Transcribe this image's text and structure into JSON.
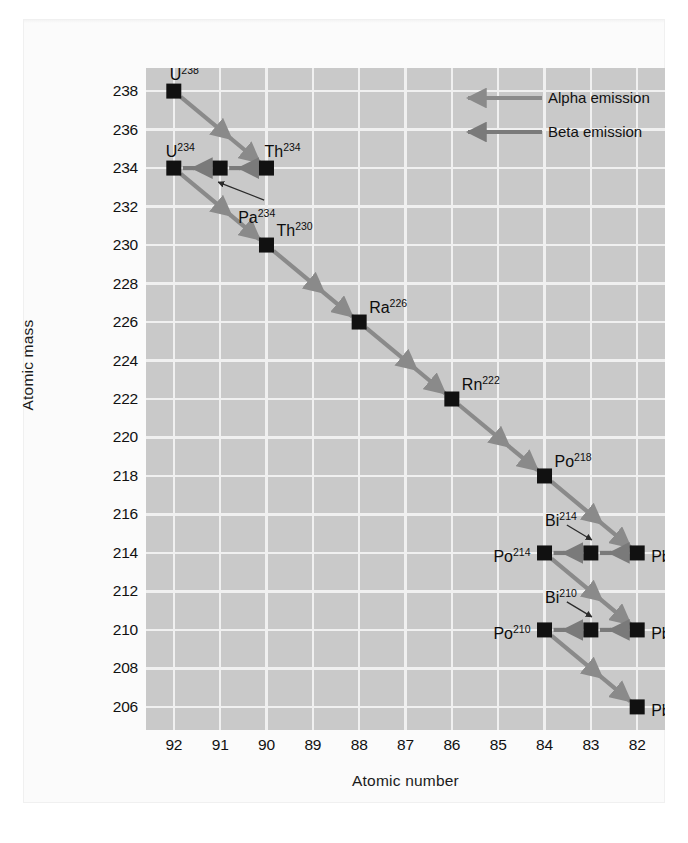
{
  "chart_data": {
    "type": "scatter",
    "title": "",
    "xlabel": "Atomic number",
    "ylabel": "Atomic mass",
    "xticks": [
      92,
      91,
      90,
      89,
      88,
      87,
      86,
      85,
      84,
      83,
      82
    ],
    "yticks": [
      238,
      236,
      234,
      232,
      230,
      228,
      226,
      224,
      222,
      220,
      218,
      216,
      214,
      212,
      210,
      208,
      206
    ],
    "xlim": [
      92.6,
      81.4
    ],
    "ylim": [
      204.8,
      239.2
    ],
    "x_axis_reversed": true,
    "grid": true,
    "grid_color": "#f0f0f0",
    "plot_background": "#c9c9c9",
    "marker": "square",
    "marker_color": "#111111",
    "arrow_color": "#6e6e6e",
    "legend_position": "top-right",
    "legend": [
      {
        "label": "Alpha emission",
        "color": "#8a8a8a",
        "type": "alpha"
      },
      {
        "label": "Beta emission",
        "color": "#7a7a7a",
        "type": "beta"
      }
    ],
    "points": [
      {
        "id": "U238",
        "element": "U",
        "mass": 238,
        "z": 92,
        "label": "U",
        "sup": "238",
        "label_dx": -4,
        "label_dy": -24,
        "label_align": "left"
      },
      {
        "id": "Th234",
        "element": "Th",
        "mass": 234,
        "z": 90,
        "label": "Th",
        "sup": "234",
        "label_dx": -2,
        "label_dy": -24,
        "label_align": "left"
      },
      {
        "id": "Pa234",
        "element": "Pa",
        "mass": 234,
        "z": 91,
        "label": "Pa",
        "sup": "234",
        "label_dx": 18,
        "label_dy": 42,
        "label_align": "left",
        "leader": true
      },
      {
        "id": "U234",
        "element": "U",
        "mass": 234,
        "z": 92,
        "label": "U",
        "sup": "234",
        "label_dx": -8,
        "label_dy": -24,
        "label_align": "left"
      },
      {
        "id": "Th230",
        "element": "Th",
        "mass": 230,
        "z": 90,
        "label": "Th",
        "sup": "230",
        "label_dx": 10,
        "label_dy": -22,
        "label_align": "left"
      },
      {
        "id": "Ra226",
        "element": "Ra",
        "mass": 226,
        "z": 88,
        "label": "Ra",
        "sup": "226",
        "label_dx": 10,
        "label_dy": -22,
        "label_align": "left"
      },
      {
        "id": "Rn222",
        "element": "Rn",
        "mass": 222,
        "z": 86,
        "label": "Rn",
        "sup": "222",
        "label_dx": 10,
        "label_dy": -22,
        "label_align": "left"
      },
      {
        "id": "Po218",
        "element": "Po",
        "mass": 218,
        "z": 84,
        "label": "Po",
        "sup": "218",
        "label_dx": 10,
        "label_dy": -22,
        "label_align": "left"
      },
      {
        "id": "Pb214",
        "element": "Pb",
        "mass": 214,
        "z": 82,
        "label": "Pb",
        "sup": "214",
        "label_dx": 14,
        "label_dy": -4,
        "label_align": "left"
      },
      {
        "id": "Bi214",
        "element": "Bi",
        "mass": 214,
        "z": 83,
        "label": "Bi",
        "sup": "214",
        "label_dx": -14,
        "label_dy": -40,
        "label_align": "right",
        "leader": true
      },
      {
        "id": "Po214",
        "element": "Po",
        "mass": 214,
        "z": 84,
        "label": "Po",
        "sup": "214",
        "label_dx": -14,
        "label_dy": -4,
        "label_align": "right"
      },
      {
        "id": "Pb210",
        "element": "Pb",
        "mass": 210,
        "z": 82,
        "label": "Pb",
        "sup": "210",
        "label_dx": 14,
        "label_dy": -4,
        "label_align": "left"
      },
      {
        "id": "Bi210",
        "element": "Bi",
        "mass": 210,
        "z": 83,
        "label": "Bi",
        "sup": "210",
        "label_dx": -14,
        "label_dy": -40,
        "label_align": "right",
        "leader": true
      },
      {
        "id": "Po210",
        "element": "Po",
        "mass": 210,
        "z": 84,
        "label": "Po",
        "sup": "210",
        "label_dx": -14,
        "label_dy": -4,
        "label_align": "right"
      },
      {
        "id": "Pb206",
        "element": "Pb",
        "mass": 206,
        "z": 82,
        "label": "Pb",
        "sup": "206",
        "label_dx": 14,
        "label_dy": -4,
        "label_align": "left"
      }
    ],
    "decays": [
      {
        "from": "U238",
        "to": "Th234",
        "type": "alpha"
      },
      {
        "from": "Th234",
        "to": "Pa234",
        "type": "beta"
      },
      {
        "from": "Pa234",
        "to": "U234",
        "type": "beta"
      },
      {
        "from": "U234",
        "to": "Th230",
        "type": "alpha"
      },
      {
        "from": "Th230",
        "to": "Ra226",
        "type": "alpha"
      },
      {
        "from": "Ra226",
        "to": "Rn222",
        "type": "alpha"
      },
      {
        "from": "Rn222",
        "to": "Po218",
        "type": "alpha"
      },
      {
        "from": "Po218",
        "to": "Pb214",
        "type": "alpha"
      },
      {
        "from": "Pb214",
        "to": "Bi214",
        "type": "beta"
      },
      {
        "from": "Bi214",
        "to": "Po214",
        "type": "beta"
      },
      {
        "from": "Po214",
        "to": "Pb210",
        "type": "alpha"
      },
      {
        "from": "Pb210",
        "to": "Bi210",
        "type": "beta"
      },
      {
        "from": "Bi210",
        "to": "Po210",
        "type": "beta"
      },
      {
        "from": "Po210",
        "to": "Pb206",
        "type": "alpha"
      }
    ]
  }
}
